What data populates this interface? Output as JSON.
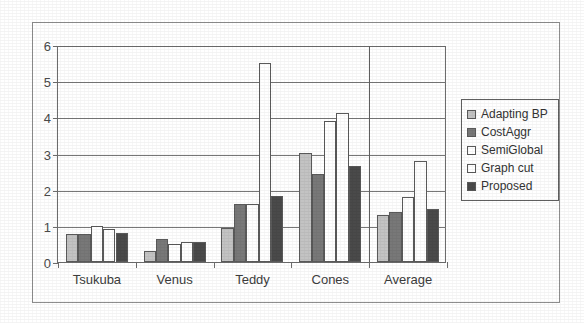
{
  "chart_data": {
    "type": "bar",
    "title": "",
    "subtitle": "",
    "xlabel": "",
    "ylabel": "",
    "categories": [
      "Tsukuba",
      "Venus",
      "Teddy",
      "Cones",
      "Average"
    ],
    "series": [
      {
        "name": "Adapting BP",
        "color": "#c3c3c3",
        "values": [
          0.78,
          0.31,
          0.94,
          3.02,
          1.29
        ]
      },
      {
        "name": "CostAggr",
        "color": "#787878",
        "values": [
          0.78,
          0.65,
          1.6,
          2.42,
          1.37
        ]
      },
      {
        "name": "SemiGlobal",
        "color": "#ffffff",
        "values": [
          1.0,
          0.51,
          1.6,
          3.9,
          1.8
        ]
      },
      {
        "name": "Graph cut",
        "color": "#ffffff",
        "values": [
          0.92,
          0.55,
          5.5,
          4.13,
          2.78
        ]
      },
      {
        "name": "Proposed",
        "color": "#4a4a4a",
        "values": [
          0.8,
          0.56,
          1.82,
          2.65,
          1.47
        ]
      }
    ],
    "ylim": [
      0,
      6
    ],
    "yticks": [
      "0",
      "1",
      "2",
      "3",
      "4",
      "5",
      "6"
    ],
    "grid": true,
    "legend_position": "right",
    "legend_entries": [
      "Adapting BP",
      "CostAggr",
      "SemiGlobal",
      "Graph cut",
      "Proposed"
    ],
    "annotations": []
  },
  "colors": {
    "axis": "#6d6d6d",
    "grid": "#777777",
    "frame": "#8e8e8e",
    "bar_outline": "#5a5a5a",
    "text": "#3d3d3d"
  }
}
